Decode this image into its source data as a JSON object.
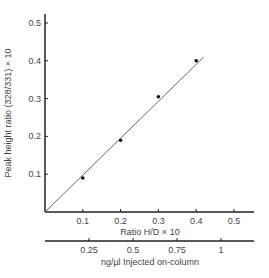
{
  "chart_data": {
    "type": "scatter",
    "title": "",
    "xlabel": "Ratio H/D × 10",
    "ylabel": "Peak height ratio (328/331) × 10",
    "secondary_xlabel": "ng/µl Injected on-column",
    "x_ticks": [
      "0.1",
      "0.2",
      "0.3",
      "0.4",
      "0.5"
    ],
    "y_ticks": [
      "0.1",
      "0.2",
      "0.3",
      "0.4",
      "0.5"
    ],
    "secondary_x_ticks": [
      "0.25",
      "0.5",
      "0.75",
      "1"
    ],
    "xlim": [
      0,
      0.52
    ],
    "ylim": [
      0,
      0.52
    ],
    "grid": false,
    "series": [
      {
        "name": "measured",
        "x": [
          0.1,
          0.2,
          0.3,
          0.4
        ],
        "y": [
          0.09,
          0.19,
          0.305,
          0.4
        ]
      }
    ],
    "fit_line": {
      "x": [
        0,
        0.42
      ],
      "y": [
        0,
        0.41
      ]
    }
  }
}
